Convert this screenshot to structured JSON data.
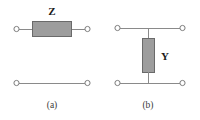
{
  "figure": {
    "background_color": "#ffffff",
    "wire_color": "#8a8a8a",
    "box_fill_color": "#9d9d9d",
    "box_stroke_color": "#6a6a6a",
    "terminal_fill_color": "#ffffff",
    "terminal_stroke_color": "#7d7d7d",
    "label_color": "#1b1b1b",
    "caption_color": "#3a3a3a"
  },
  "panels": [
    {
      "id": "panel-a",
      "caption": "(a)",
      "element_label": "Z",
      "element_orientation": "horizontal",
      "element_kind": "series-impedance",
      "terminal_count": 4
    },
    {
      "id": "panel-b",
      "caption": "(b)",
      "element_label": "Y",
      "element_orientation": "vertical",
      "element_kind": "shunt-admittance",
      "terminal_count": 4
    }
  ]
}
